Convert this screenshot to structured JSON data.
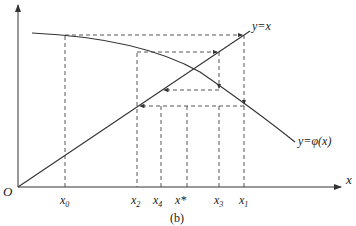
{
  "diagram": {
    "type": "fixed-point-iteration",
    "caption": "(b)",
    "origin_label": "O",
    "x_axis_label": "x",
    "line_label": "y=x",
    "curve_label": "y=φ(x)",
    "x_ticks": [
      {
        "name": "x0",
        "label": "x",
        "sub": "0"
      },
      {
        "name": "x2",
        "label": "x",
        "sub": "2"
      },
      {
        "name": "x4",
        "label": "x",
        "sub": "4"
      },
      {
        "name": "xstar",
        "label": "x*",
        "sub": ""
      },
      {
        "name": "x3",
        "label": "x",
        "sub": "3"
      },
      {
        "name": "x1",
        "label": "x",
        "sub": "1"
      }
    ],
    "colors": {
      "ink": "#333333",
      "dash": "#444444"
    }
  }
}
